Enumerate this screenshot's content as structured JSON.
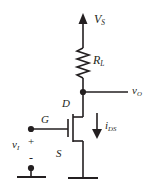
{
  "figure": {
    "type": "schematic",
    "stroke_color": "#231f20",
    "background_color": "#ffffff"
  },
  "labels": {
    "supply": {
      "main": "V",
      "sub": "S"
    },
    "load_resistor": {
      "main": "R",
      "sub": "L"
    },
    "output": {
      "main": "v",
      "sub": "O"
    },
    "drain": "D",
    "gate": "G",
    "source": "S",
    "drain_current": {
      "main": "i",
      "sub": "DS"
    },
    "input": {
      "main": "v",
      "sub": "I"
    },
    "plus": "+",
    "minus": "-"
  },
  "components": {
    "supply_arrow": "arrow-up-icon",
    "resistor": "zigzag-resistor-icon",
    "transistor": "n-channel-mosfet-icon",
    "current_arrow": "arrow-down-icon",
    "ground_input": "ground-icon",
    "ground_source": "ground-icon",
    "output_node": "junction-dot",
    "input_terminal_top": "terminal-dot",
    "input_terminal_bottom": "terminal-dot"
  }
}
